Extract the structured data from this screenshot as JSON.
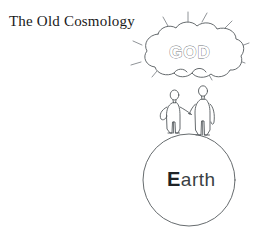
{
  "illustration": {
    "title": "The Old Cosmology",
    "caption_font_style": "serif",
    "background_color": "#ffffff",
    "ink_color": "#555a5e",
    "elements": {
      "cloud": {
        "name": "glory-cloud",
        "inner_text": "GOD",
        "text_style": "outline",
        "ray_count": 8
      },
      "figures": {
        "name": "two-human-figures",
        "count": 2,
        "pose": "holding hands standing on earth",
        "left_label": "left-person",
        "right_label": "right-person"
      },
      "earth": {
        "name": "earth-sphere",
        "label": "Earth",
        "shape": "circle"
      }
    }
  },
  "earth_label_parts": {
    "cap": "E",
    "rest": "arth"
  },
  "god_text": "GOD"
}
